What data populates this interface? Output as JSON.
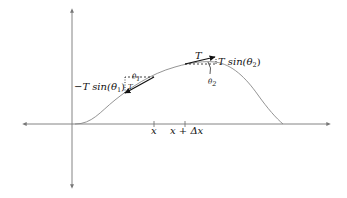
{
  "diagram": {
    "type": "string-tension-diagram",
    "colors": {
      "axis": "#777777",
      "curve": "#888888",
      "vector": "#111111",
      "background": "#ffffff"
    },
    "axes": {
      "horizontal": {
        "x1": 22,
        "x2": 330,
        "y": 124,
        "arrows": "both"
      },
      "vertical": {
        "x": 72,
        "y1": 8,
        "y2": 189,
        "arrows": "both"
      }
    },
    "ticks": [
      {
        "x": 154,
        "label": "x"
      },
      {
        "x": 185,
        "label_main": "x + Δx"
      }
    ],
    "labels": {
      "left_vertical_component": "−T sin(θ",
      "left_sub": "1",
      "close_paren": ")",
      "left_theta": "θ",
      "left_theta_sub": "1",
      "left_tension": "T",
      "right_tension": "T",
      "right_vertical_component": "T sin(θ",
      "right_sub": "2",
      "right_theta": "θ",
      "right_theta_sub": "2",
      "tick_x": "x",
      "tick_x_dx": "x + Δx"
    }
  }
}
